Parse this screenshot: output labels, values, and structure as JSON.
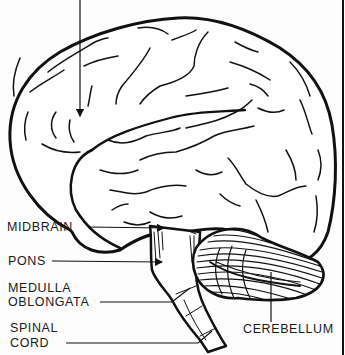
{
  "diagram": {
    "colors": {
      "ink": "#111111",
      "background": "#fdfdfd",
      "label": "#1a1a1a"
    },
    "labels": {
      "midbrain": "MIDBRAIN",
      "pons": "PONS",
      "medulla_line1": "MEDULLA",
      "medulla_line2": "OBLONGATA",
      "spinal_line1": "SPINAL",
      "spinal_line2": "CORD",
      "cerebellum": "CEREBELLUM"
    },
    "structures": [
      "cerebrum",
      "midbrain",
      "pons",
      "medulla-oblongata",
      "spinal-cord",
      "cerebellum"
    ],
    "top_arrow": {
      "from": [
        80,
        0
      ],
      "to": [
        80,
        117
      ],
      "target": "cerebrum"
    }
  }
}
